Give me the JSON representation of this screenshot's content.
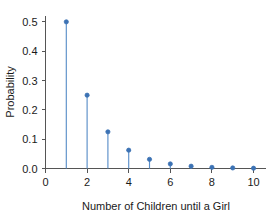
{
  "chart_data": {
    "type": "scatter",
    "plot_style": "stem",
    "title": "",
    "xlabel": "Number of Children until a Girl",
    "ylabel": "Probability",
    "x": [
      1,
      2,
      3,
      4,
      5,
      6,
      7,
      8,
      9,
      10
    ],
    "values": [
      0.5,
      0.25,
      0.125,
      0.0625,
      0.03125,
      0.015625,
      0.0078125,
      0.00390625,
      0.001953125,
      0.0009765625
    ],
    "series": [
      {
        "name": "Probability",
        "values": [
          0.5,
          0.25,
          0.125,
          0.0625,
          0.03125,
          0.015625,
          0.0078125,
          0.00390625,
          0.001953125,
          0.0009765625
        ]
      }
    ],
    "xlim": [
      0,
      10.6
    ],
    "ylim": [
      0.0,
      0.52
    ],
    "xticks": [
      0,
      2,
      4,
      6,
      8,
      10
    ],
    "xtick_labels": [
      "0",
      "2",
      "4",
      "6",
      "8",
      "10"
    ],
    "yticks": [
      0.0,
      0.1,
      0.2,
      0.3,
      0.4,
      0.5
    ],
    "ytick_labels": [
      "0.0",
      "0.1",
      "0.2",
      "0.3",
      "0.4",
      "0.5"
    ],
    "grid": false,
    "legend": false,
    "legend_position": "none",
    "marker_color": "#3c72b4",
    "stem_color": "#5b8fc9",
    "axis_color": "#555555",
    "background_color": "#ffffff"
  },
  "axes": {
    "y_title": "Probability",
    "x_title": "Number of Children until a Girl"
  }
}
